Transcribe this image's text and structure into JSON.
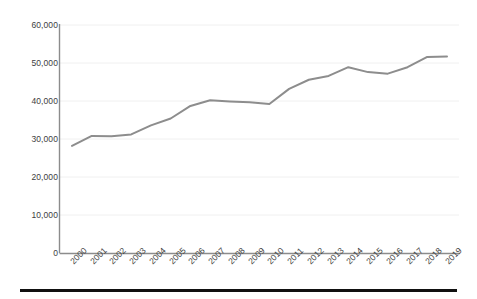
{
  "chart_data": {
    "type": "line",
    "title": "",
    "subtitle": "",
    "xlabel": "",
    "ylabel": "",
    "categories": [
      "2000",
      "2001",
      "2002",
      "2003",
      "2004",
      "2005",
      "2006",
      "2007",
      "2008",
      "2009",
      "2010",
      "2011",
      "2012",
      "2013",
      "2014",
      "2015",
      "2016",
      "2017",
      "2018",
      "2019"
    ],
    "x": [
      2000,
      2001,
      2002,
      2003,
      2004,
      2005,
      2006,
      2007,
      2008,
      2009,
      2010,
      2011,
      2012,
      2013,
      2014,
      2015,
      2016,
      2017,
      2018,
      2019
    ],
    "series": [
      {
        "name": "Value",
        "color": "#8d8d8d",
        "values": [
          28200,
          30800,
          30700,
          31200,
          33600,
          35400,
          38700,
          40200,
          39900,
          39700,
          39200,
          43200,
          45600,
          46600,
          48900,
          47600,
          47200,
          48900,
          51600,
          51700
        ]
      }
    ],
    "ylim": [
      0,
      60000
    ],
    "ytick_values": [
      0,
      10000,
      20000,
      30000,
      40000,
      50000,
      60000
    ],
    "ytick_labels": [
      "0",
      "10,000",
      "20,000",
      "30,000",
      "40,000",
      "50,000",
      "60,000"
    ],
    "xtick_labels": [
      "2000",
      "2001",
      "2002",
      "2003",
      "2004",
      "2005",
      "2006",
      "2007",
      "2008",
      "2009",
      "2010",
      "2011",
      "2012",
      "2013",
      "2014",
      "2015",
      "2016",
      "2017",
      "2018",
      "2019"
    ],
    "grid": true,
    "grid_axis": "y",
    "grid_color": "#f0f0f0",
    "legend": false,
    "legend_position": "none",
    "axis_color": "#8c8c8c",
    "tick_label_color": "#3d3d3d",
    "annotations": []
  },
  "figure": {
    "background_color": "#ffffff",
    "bottom_rule_color": "#111111",
    "xlabel_rotation_deg": -45
  }
}
